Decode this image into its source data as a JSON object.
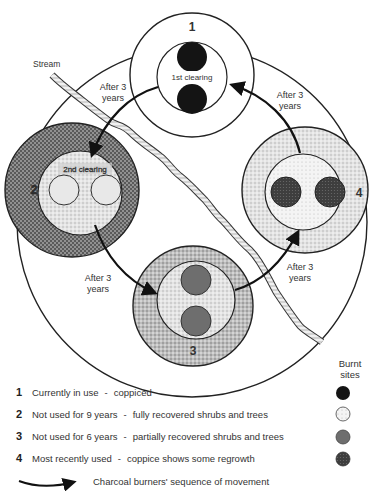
{
  "diagram": {
    "stream_label": "Stream",
    "sites": [
      {
        "number": "1",
        "clearing_label": "1st clearing",
        "burnt_site_fill": "#1a1a1a"
      },
      {
        "number": "2",
        "clearing_label": "2nd clearing",
        "burnt_site_fill": "#e6e6e6"
      },
      {
        "number": "3",
        "clearing_label": "",
        "burnt_site_fill": "#6e6e6e"
      },
      {
        "number": "4",
        "clearing_label": "",
        "burnt_site_fill": "#4a4a4a"
      }
    ],
    "arrows": [
      {
        "from": "1",
        "to": "2",
        "label_line1": "After 3",
        "label_line2": "years"
      },
      {
        "from": "2",
        "to": "3",
        "label_line1": "After 3",
        "label_line2": "years"
      },
      {
        "from": "3",
        "to": "4",
        "label_line1": "After 3",
        "label_line2": "years"
      },
      {
        "from": "4",
        "to": "1",
        "label_line1": "After 3",
        "label_line2": "years"
      }
    ]
  },
  "legend": {
    "burnt_sites_header_line1": "Burnt",
    "burnt_sites_header_line2": "sites",
    "items": [
      {
        "number": "1",
        "status": "Currently in use",
        "description": "coppiced"
      },
      {
        "number": "2",
        "status": "Not used for 9 years",
        "description": "fully recovered shrubs and trees"
      },
      {
        "number": "3",
        "status": "Not used for 6 years",
        "description": "partially recovered shrubs and trees"
      },
      {
        "number": "4",
        "status": "Most recently used",
        "description": "coppice shows some regrowth"
      }
    ],
    "separator": "-",
    "sequence_label": "Charcoal burners' sequence of movement"
  }
}
